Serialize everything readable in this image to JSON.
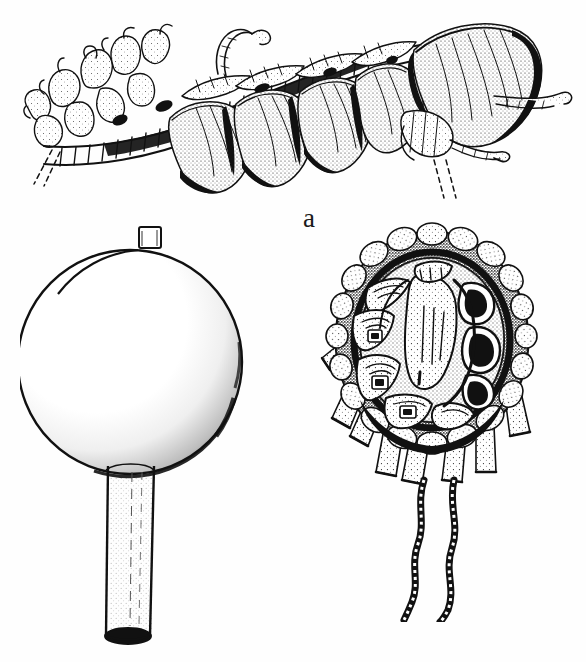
{
  "figure": {
    "kind": "scientific-line-drawing",
    "background_color": "#fefefe",
    "ink_color": "#111111",
    "width": 586,
    "height": 662,
    "panels": [
      {
        "id": "a",
        "label": "a",
        "label_x": 303,
        "label_y": 205,
        "description": "Lateral view of a segmented marine organism with a large terminal bell-shaped hood, a series of overlapping hood-like lateral lobes, a jointed axis bearing ringed segments, and branching finger-like appendages at the left end; two dashed guide lines trail from the lower right."
      },
      {
        "id": "b",
        "label": "b",
        "label_x": 197,
        "label_y": 563,
        "description": "Stippled spherical float (pneumatophore) with a small rectangular apical pore, attached below to a long straight cylindrical stalk that ends in an open dark ellipse."
      },
      {
        "id": "c",
        "label": "c",
        "label_x": 394,
        "label_y": 566,
        "description": "Oval disc seen face-on with a small apical spike, a stippled beaded rim, a complex chambered interior of nested rectangular compartments, a ring of conical appendages radiating from the margin, and two long sinuous trailing tentacles."
      }
    ]
  }
}
